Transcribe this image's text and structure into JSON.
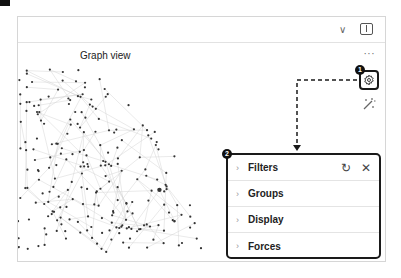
{
  "header": {
    "chevron_icon": "chevron-down-icon",
    "sidebar_toggle_icon": "sidebar-toggle-icon"
  },
  "view": {
    "title": "Graph view",
    "more_label": "···"
  },
  "toolbar": {
    "settings_icon": "gear-icon",
    "animate_icon": "magic-wand-icon"
  },
  "callouts": {
    "badge_1": "1",
    "badge_2": "2"
  },
  "panel": {
    "sections": [
      {
        "label": "Filters",
        "chevron": "›"
      },
      {
        "label": "Groups",
        "chevron": "›"
      },
      {
        "label": "Display",
        "chevron": "›"
      },
      {
        "label": "Forces",
        "chevron": "›"
      }
    ],
    "reset_icon": "↻",
    "close_icon": "✕"
  },
  "colors": {
    "callout": "#1a1a1a",
    "node": "#333333",
    "edge": "#d0d0d0"
  }
}
